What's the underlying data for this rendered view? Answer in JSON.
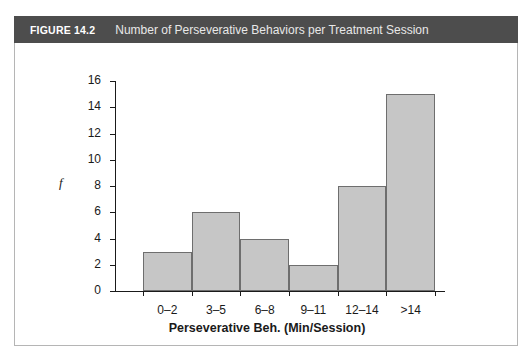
{
  "figure": {
    "number": "FIGURE 14.2",
    "caption": "Number of Perseverative Behaviors per Treatment Session",
    "header_color": "#4d4d4d",
    "panel_border_color": "#b5b5b5"
  },
  "chart_data": {
    "type": "bar",
    "title": "Number of Perseverative Behaviors per Treatment Session",
    "categories": [
      "0–2",
      "3–5",
      "6–8",
      "9–11",
      "12–14",
      ">14"
    ],
    "values": [
      3,
      6,
      4,
      2,
      8,
      15
    ],
    "xlabel": "Perseverative Beh. (Min/Session)",
    "ylabel": "f",
    "ylim": [
      0,
      16
    ],
    "yticks": [
      0,
      2,
      4,
      6,
      8,
      10,
      12,
      14,
      16
    ],
    "ytick_labels": [
      "0",
      "2",
      "4",
      "6",
      "8",
      "10",
      "12",
      "14",
      "16"
    ],
    "grid": false,
    "legend": null,
    "bar_fill_color": "#c6c6c6",
    "bar_edge_color": "#6e6e6e",
    "axis_color": "#1a1a1a"
  }
}
